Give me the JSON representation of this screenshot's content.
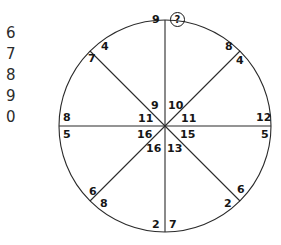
{
  "page": {
    "background_color": "#ffffff",
    "ink_color": "#161616"
  },
  "margin_column": {
    "name": "handwriting-practice-digits",
    "digits": [
      "6",
      "7",
      "8",
      "9",
      "0"
    ]
  },
  "figure": {
    "shape": "circle",
    "center": {
      "x": 165,
      "y": 126
    },
    "radius": 106,
    "diameters": [
      {
        "name": "vertical-diameter",
        "angle_deg": 90
      },
      {
        "name": "horizontal-diameter",
        "angle_deg": 0
      },
      {
        "name": "diagonal-diameter-ne-sw",
        "angle_deg": 45
      },
      {
        "name": "diagonal-diameter-nw-se",
        "angle_deg": 135
      }
    ],
    "unknown_marker": "?",
    "labels": {
      "top_left_of_vertical": "9",
      "top_right_of_vertical": "?",
      "upper_left_arc_outer": "4",
      "upper_left_arc_inner": "7",
      "upper_right_arc_outer": "8",
      "upper_right_arc_inner": "4",
      "left_above_horizontal": "8",
      "left_below_horizontal": "5",
      "right_above_horizontal": "12",
      "right_below_horizontal": "5",
      "center_upper_left": "9",
      "center_upper_right": "10",
      "center_left_upper": "11",
      "center_right_upper": "11",
      "center_left_lower": "16",
      "center_right_lower": "15",
      "center_lower_left": "16",
      "center_lower_right": "13",
      "lower_left_arc_outer": "6",
      "lower_left_arc_inner": "8",
      "lower_right_arc_outer": "6",
      "lower_right_arc_inner": "2",
      "bottom_left_of_vertical": "2",
      "bottom_right_of_vertical": "7"
    }
  }
}
